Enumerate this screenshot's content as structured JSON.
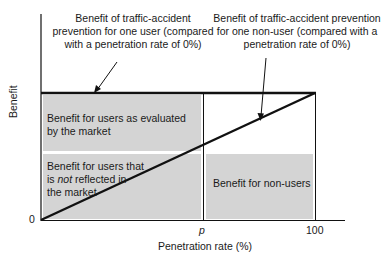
{
  "annotations": {
    "user_benefit": [
      "Benefit of traffic-accident",
      "prevention for one user (compared",
      "with a penetration rate of 0%)"
    ],
    "nonuser_benefit": [
      "Benefit of traffic-accident prevention",
      "for one non-user (compared with a",
      "penetration rate of 0%)"
    ]
  },
  "regions": {
    "users_market": [
      "Benefit for users as evaluated",
      "by the market"
    ],
    "users_not_reflected_1": "Benefit for users that",
    "users_not_reflected_2a": "is ",
    "users_not_reflected_2b": "not",
    "users_not_reflected_2c": " reflected in",
    "users_not_reflected_3": "the market",
    "nonusers": "Benefit for non-users"
  },
  "axes": {
    "y_label": "Benefit",
    "x_label": "Penetration rate (%)",
    "origin": "0",
    "p_tick": "p",
    "max_tick": "100"
  },
  "colors": {
    "shade": "#d4d4d4",
    "line": "#111111"
  }
}
